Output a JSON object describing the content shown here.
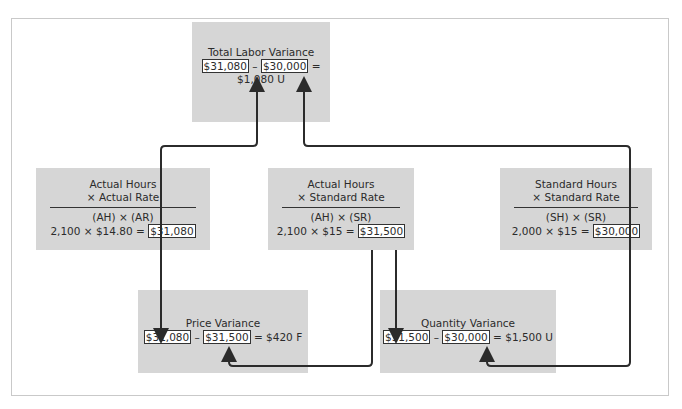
{
  "diagram": {
    "total": {
      "title": "Total Labor Variance",
      "a": "$31,080",
      "minus": "–",
      "b": "$30,000",
      "result": "= $1,080 U"
    },
    "actual_actual": {
      "line1": "Actual Hours",
      "line2": "× Actual Rate",
      "formula": "(AH) × (AR)",
      "calc": "2,100 × $14.80 =",
      "value": "$31,080"
    },
    "actual_standard": {
      "line1": "Actual Hours",
      "line2": "× Standard Rate",
      "formula": "(AH) × (SR)",
      "calc": "2,100 × $15 =",
      "value": "$31,500"
    },
    "standard_standard": {
      "line1": "Standard Hours",
      "line2": "× Standard Rate",
      "formula": "(SH) × (SR)",
      "calc": "2,000 × $15 =",
      "value": "$30,000"
    },
    "price": {
      "title": "Price Variance",
      "a": "$31,080",
      "minus": "–",
      "b": "$31,500",
      "result": "= $420 F"
    },
    "quantity": {
      "title": "Quantity Variance",
      "a": "$31,500",
      "minus": "–",
      "b": "$30,000",
      "result": "= $1,500 U"
    },
    "colors": {
      "box": "#d6d6d6",
      "line": "#2b2b2b",
      "frame": "#c9c9c9"
    }
  }
}
